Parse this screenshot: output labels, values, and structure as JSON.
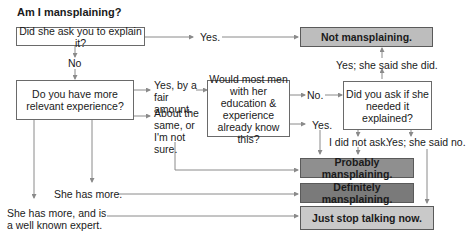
{
  "title": "Am I mansplaining?",
  "nodes": {
    "q1": "Did she ask you to explain it?",
    "q2": "Do you have more relevant experience?",
    "q3": "Would most men with her education & experience already know this?",
    "q4": "Did you ask if she needed it explained?",
    "o1": "Not mansplaining.",
    "o2": "Probably mansplaining.",
    "o3": "Definitely mansplaining.",
    "o4": "Just stop talking now."
  },
  "edges": {
    "q1_yes": "Yes.",
    "q1_no": "No",
    "q2_fair": "Yes, by a fair amount.",
    "q2_same": "About the same, or I'm not sure.",
    "q2_she_more": "She has more.",
    "q2_expert": "She has more, and is a well known expert.",
    "q3_no": "No.",
    "q3_yes": "Yes.",
    "q4_yes_did": "Yes; she said she did.",
    "q4_not_ask": "I did not ask.",
    "q4_yes_no": "Yes; she said no."
  },
  "colors": {
    "not": "#bdbdbd",
    "probably": "#8f8f8f",
    "definitely": "#7a7a7a",
    "stop": "#c9c9c9",
    "line": "#8a8a8a"
  }
}
